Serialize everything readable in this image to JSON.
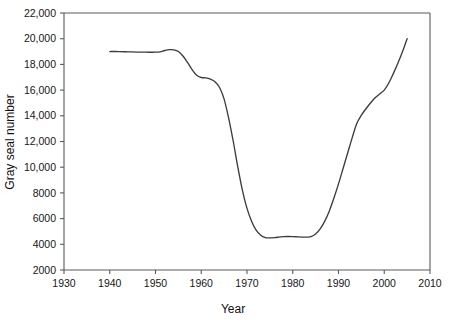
{
  "chart_data": {
    "type": "line",
    "title": "",
    "xlabel": "Year",
    "ylabel": "Gray seal number",
    "xlim": [
      1930,
      2010
    ],
    "ylim": [
      2000,
      22000
    ],
    "grid": false,
    "legend": "none",
    "x_ticks": [
      "1930",
      "1940",
      "1950",
      "1960",
      "1970",
      "1980",
      "1990",
      "2000",
      "2010"
    ],
    "y_ticks": [
      "2000",
      "4000",
      "6000",
      "8000",
      "10,000",
      "12,000",
      "14,000",
      "16,000",
      "18,000",
      "20,000",
      "22,000"
    ],
    "x_tick_values": [
      1930,
      1940,
      1950,
      1960,
      1970,
      1980,
      1990,
      2000,
      2010
    ],
    "y_tick_values": [
      2000,
      4000,
      6000,
      8000,
      10000,
      12000,
      14000,
      16000,
      18000,
      20000,
      22000
    ],
    "series": [
      {
        "name": "Gray seal number",
        "color": "#3c3c3c",
        "x": [
          1940,
          1942,
          1944,
          1946,
          1948,
          1950,
          1951,
          1952,
          1953,
          1954,
          1955,
          1956,
          1957,
          1958,
          1959,
          1960,
          1961,
          1962,
          1963,
          1964,
          1965,
          1966,
          1967,
          1968,
          1969,
          1970,
          1971,
          1972,
          1973,
          1974,
          1975,
          1976,
          1977,
          1978,
          1979,
          1980,
          1981,
          1982,
          1983,
          1984,
          1985,
          1986,
          1987,
          1988,
          1989,
          1990,
          1991,
          1992,
          1993,
          1994,
          1995,
          1996,
          1997,
          1998,
          1999,
          2000,
          2001,
          2002,
          2003,
          2004,
          2005
        ],
        "y": [
          19000,
          19000,
          18980,
          18960,
          18950,
          18950,
          18980,
          19080,
          19150,
          19130,
          19000,
          18650,
          18150,
          17600,
          17150,
          16980,
          16950,
          16850,
          16650,
          16200,
          15300,
          13800,
          12000,
          10000,
          8200,
          6800,
          5800,
          5100,
          4700,
          4520,
          4500,
          4520,
          4560,
          4600,
          4610,
          4600,
          4580,
          4560,
          4560,
          4600,
          4800,
          5200,
          5800,
          6600,
          7600,
          8700,
          9900,
          11100,
          12300,
          13400,
          14050,
          14550,
          15000,
          15400,
          15700,
          16000,
          16550,
          17300,
          18100,
          19000,
          20000
        ]
      }
    ]
  },
  "axes": {
    "y_title": "Gray seal number",
    "x_title": "Year"
  }
}
